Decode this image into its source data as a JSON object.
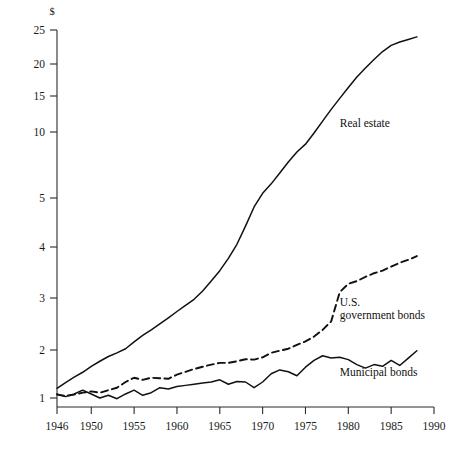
{
  "chart_data": {
    "type": "line",
    "title": "",
    "xlabel": "",
    "ylabel": "$",
    "yscale": "log",
    "grid": false,
    "legend": "inline-labels",
    "xlim": [
      1946,
      1990
    ],
    "ylim": [
      1,
      25
    ],
    "xticks": [
      1946,
      1950,
      1955,
      1960,
      1965,
      1970,
      1975,
      1980,
      1985,
      1990
    ],
    "xtick_labels": [
      "1946",
      "1950",
      "1955",
      "1960",
      "1965",
      "1970",
      "1975",
      "1980",
      "1985",
      "1990"
    ],
    "yticks": [
      1,
      2,
      3,
      4,
      5,
      10,
      15,
      20,
      25
    ],
    "ytick_labels": [
      "1",
      "2",
      "3",
      "4",
      "5",
      "10",
      "15",
      "20",
      "25"
    ],
    "series": [
      {
        "name": "Real estate",
        "style": "solid",
        "label_x": 1979,
        "label_y": 10.6,
        "x": [
          1946,
          1947,
          1948,
          1949,
          1950,
          1951,
          1952,
          1953,
          1954,
          1955,
          1956,
          1957,
          1958,
          1959,
          1960,
          1961,
          1962,
          1963,
          1964,
          1965,
          1966,
          1967,
          1968,
          1969,
          1970,
          1971,
          1972,
          1973,
          1974,
          1975,
          1976,
          1977,
          1978,
          1979,
          1980,
          1981,
          1982,
          1983,
          1984,
          1985,
          1986,
          1987,
          1988
        ],
        "y": [
          1.15,
          1.25,
          1.35,
          1.45,
          1.58,
          1.7,
          1.82,
          1.92,
          2.02,
          2.13,
          2.24,
          2.34,
          2.45,
          2.57,
          2.7,
          2.83,
          2.97,
          3.12,
          3.3,
          3.5,
          3.75,
          4.05,
          4.4,
          4.8,
          5.25,
          5.8,
          6.5,
          7.3,
          8.1,
          8.8,
          9.9,
          11.3,
          12.9,
          14.6,
          16.2,
          17.8,
          19.3,
          20.6,
          21.7,
          22.6,
          23.1,
          23.5,
          23.9
        ]
      },
      {
        "name": "U.S. government bonds",
        "style": "dashed",
        "label_x": 1979,
        "label_y": 2.82,
        "x": [
          1946,
          1947,
          1948,
          1949,
          1950,
          1951,
          1952,
          1953,
          1954,
          1955,
          1956,
          1957,
          1958,
          1959,
          1960,
          1961,
          1962,
          1963,
          1964,
          1965,
          1966,
          1967,
          1968,
          1969,
          1970,
          1971,
          1972,
          1973,
          1974,
          1975,
          1976,
          1977,
          1978,
          1979,
          1980,
          1981,
          1982,
          1983,
          1984,
          1985,
          1986,
          1987,
          1988
        ],
        "y": [
          1.05,
          1.03,
          1.05,
          1.08,
          1.1,
          1.08,
          1.12,
          1.16,
          1.26,
          1.34,
          1.3,
          1.34,
          1.33,
          1.32,
          1.4,
          1.46,
          1.52,
          1.57,
          1.62,
          1.66,
          1.66,
          1.7,
          1.75,
          1.74,
          1.8,
          1.92,
          1.98,
          2.02,
          2.08,
          2.14,
          2.22,
          2.34,
          2.5,
          3.1,
          3.25,
          3.3,
          3.38,
          3.45,
          3.5,
          3.58,
          3.66,
          3.72,
          3.8
        ]
      },
      {
        "name": "Municipal bonds",
        "style": "solid",
        "label_x": 1979,
        "label_y": 1.38,
        "x": [
          1946,
          1947,
          1948,
          1949,
          1950,
          1951,
          1952,
          1953,
          1954,
          1955,
          1956,
          1957,
          1958,
          1959,
          1960,
          1961,
          1962,
          1963,
          1964,
          1965,
          1966,
          1967,
          1968,
          1969,
          1970,
          1971,
          1972,
          1973,
          1974,
          1975,
          1976,
          1977,
          1978,
          1979,
          1980,
          1981,
          1982,
          1983,
          1984,
          1985,
          1986,
          1987,
          1988
        ],
        "y": [
          1.06,
          1.02,
          1.06,
          1.12,
          1.06,
          1.0,
          1.04,
          0.99,
          1.06,
          1.12,
          1.04,
          1.08,
          1.16,
          1.14,
          1.18,
          1.2,
          1.22,
          1.24,
          1.26,
          1.3,
          1.22,
          1.27,
          1.26,
          1.16,
          1.26,
          1.42,
          1.5,
          1.46,
          1.38,
          1.56,
          1.72,
          1.84,
          1.78,
          1.8,
          1.74,
          1.62,
          1.54,
          1.62,
          1.58,
          1.72,
          1.6,
          1.78,
          1.98
        ]
      }
    ]
  },
  "labels": {
    "currency_unit": "$",
    "real_estate": "Real estate",
    "gov_bonds_line1": "U.S.",
    "gov_bonds_line2": "government bonds",
    "municipal_bonds": "Municipal bonds"
  }
}
